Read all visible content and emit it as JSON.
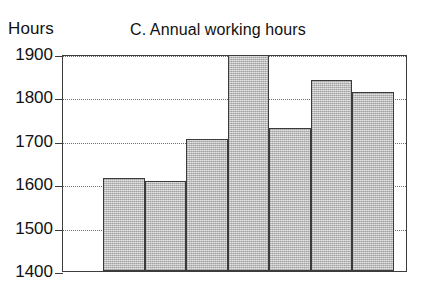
{
  "axis_unit_label": "Hours",
  "chart_data": {
    "type": "bar",
    "title": "C. Annual working hours",
    "xlabel": "",
    "ylabel": "Hours",
    "ylim": [
      1400,
      1900
    ],
    "yticks": [
      1900,
      1800,
      1700,
      1600,
      1500,
      1400
    ],
    "ytick_labels": [
      "1900",
      "1800",
      "1700",
      "1600",
      "1500",
      "1400"
    ],
    "grid": true,
    "grid_style": "dotted",
    "legend": "none",
    "bar_fill_color": "#c9c9c9",
    "bar_edge_color": "#3b3b3b",
    "categories": [
      "Germany",
      "France",
      "UK",
      "USA",
      "Finland",
      "Poland",
      "Japan"
    ],
    "values": [
      1615,
      1608,
      1705,
      1925,
      1730,
      1840,
      1812
    ]
  }
}
